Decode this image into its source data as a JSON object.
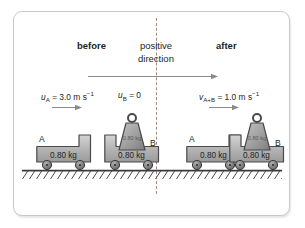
{
  "figure": {
    "headers": {
      "before": "before",
      "after": "after",
      "positive_direction_line1": "positive",
      "positive_direction_line2": "direction"
    },
    "velocities": {
      "a_before": {
        "symbol": "u",
        "subscript": "A",
        "value": "3.0",
        "unit": "m s",
        "exponent": "−1"
      },
      "b_before": {
        "symbol": "u",
        "subscript": "B",
        "value": "0"
      },
      "ab_after": {
        "symbol": "v",
        "subscript": "A+B",
        "value": "1.0",
        "unit": "m s",
        "exponent": "−1"
      }
    },
    "carts": {
      "a_before": {
        "id": "A",
        "mass": "0.80 kg"
      },
      "b_before": {
        "id": "B",
        "mass": "0.80 kg"
      },
      "a_after": {
        "id": "A",
        "mass": "0.80 kg"
      },
      "b_after": {
        "id": "B",
        "mass": "0.80 kg"
      }
    },
    "weights": {
      "before": {
        "mass": "0.80 kg"
      },
      "after": {
        "mass": "0.80 kg"
      }
    },
    "colors": {
      "frame_border": "#c9c9c9",
      "divider": "#a08a86",
      "text": "#231f20",
      "cart_body": "#b3b3b3",
      "cart_outline": "#4d4d4d",
      "wheel": "#808080",
      "ground_line": "#4d4d4d",
      "arrow": "#808080",
      "weight_body": "#999999"
    }
  }
}
